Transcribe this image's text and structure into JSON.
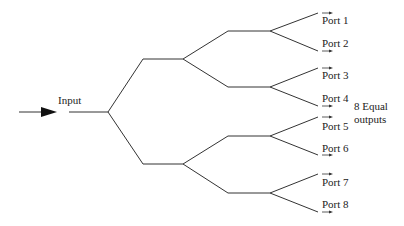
{
  "diagram": {
    "input_label": "Input",
    "outputs_label_line1": "8 Equal",
    "outputs_label_line2": "outputs",
    "ports": [
      "Port 1",
      "Port 2",
      "Port 3",
      "Port 4",
      "Port 5",
      "Port 6",
      "Port 7",
      "Port 8"
    ],
    "colors": {
      "line": "#333333",
      "text": "#222222"
    }
  }
}
